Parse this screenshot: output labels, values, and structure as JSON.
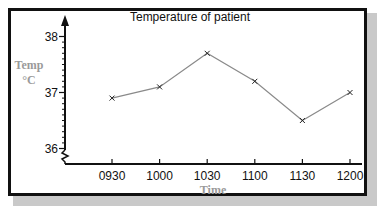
{
  "chart_data": {
    "type": "line",
    "title": "Temperature of patient",
    "xlabel": "Time",
    "ylabel": "Temp °C",
    "ylabel_lines": [
      "Temp",
      "°C"
    ],
    "categories": [
      "0930",
      "1000",
      "1030",
      "1100",
      "1130",
      "1200"
    ],
    "series": [
      {
        "name": "Temperature",
        "values": [
          36.9,
          37.1,
          37.7,
          37.2,
          36.5,
          37.0
        ]
      }
    ],
    "yticks": [
      "36",
      "37",
      "38"
    ],
    "ytick_values": [
      36,
      37,
      38
    ],
    "ylim": [
      36,
      38
    ],
    "y_minor_tick_step": 0.1,
    "y_axis_break": true,
    "grid": false,
    "legend": "none",
    "marker": "x",
    "line_color": "#8a8a8a",
    "axis_label_color": "#9a9a9a"
  }
}
